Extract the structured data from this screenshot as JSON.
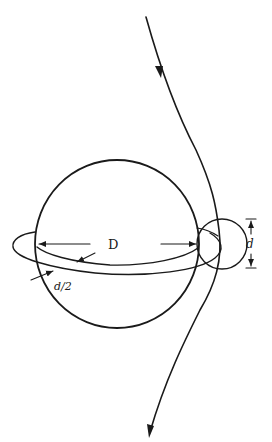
{
  "diagram": {
    "labels": {
      "big_diameter": "D",
      "small_diameter": "d",
      "half_small": "d/2"
    },
    "colors": {
      "ink": "#1a1a1a",
      "background": "#ffffff"
    },
    "elements": [
      "trajectory-curve-with-arrows",
      "large-sphere",
      "ring-torus",
      "small-cross-section-circle",
      "dimension-D",
      "dimension-d",
      "dimension-d-half"
    ]
  }
}
